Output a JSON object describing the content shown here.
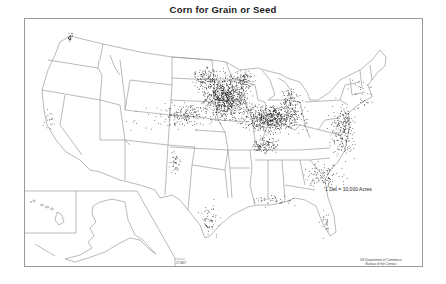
{
  "map": {
    "title": "Corn for Grain or Seed",
    "legend": "1 Dot = 10,000 Acres",
    "credit_line1": "US Department of Commerce",
    "credit_line2": "Bureau of the Census",
    "map_code": "27-M07",
    "colors": {
      "background": "#ffffff",
      "frame": "#9a9a9a",
      "state_lines": "#8c8c8c",
      "dots": "#111111"
    },
    "insets": [
      "Hawaii",
      "Alaska"
    ],
    "dot_clusters": [
      {
        "region": "Iowa-Minnesota-Nebraska core",
        "cx": 225,
        "cy": 97,
        "rx": 22,
        "ry": 22,
        "count": 900
      },
      {
        "region": "Illinois-Indiana-Ohio belt",
        "cx": 272,
        "cy": 118,
        "rx": 30,
        "ry": 13,
        "count": 700
      },
      {
        "region": "South Dakota east",
        "cx": 205,
        "cy": 78,
        "rx": 12,
        "ry": 12,
        "count": 120
      },
      {
        "region": "Nebraska-Kansas",
        "cx": 185,
        "cy": 115,
        "rx": 20,
        "ry": 12,
        "count": 160
      },
      {
        "region": "Kentucky-Tennessee",
        "cx": 265,
        "cy": 145,
        "rx": 14,
        "ry": 10,
        "count": 120
      },
      {
        "region": "Virginia-Maryland-Pennsylvania",
        "cx": 342,
        "cy": 130,
        "rx": 12,
        "ry": 25,
        "count": 220
      },
      {
        "region": "Michigan",
        "cx": 290,
        "cy": 100,
        "rx": 10,
        "ry": 12,
        "count": 90
      },
      {
        "region": "Carolinas-Georgia",
        "cx": 325,
        "cy": 175,
        "rx": 18,
        "ry": 14,
        "count": 110
      },
      {
        "region": "Texas coast",
        "cx": 210,
        "cy": 220,
        "rx": 10,
        "ry": 18,
        "count": 60
      },
      {
        "region": "Texas panhandle",
        "cx": 175,
        "cy": 162,
        "rx": 6,
        "ry": 12,
        "count": 40
      },
      {
        "region": "Gulf coast",
        "cx": 275,
        "cy": 200,
        "rx": 25,
        "ry": 5,
        "count": 45
      },
      {
        "region": "Florida",
        "cx": 325,
        "cy": 222,
        "rx": 5,
        "ry": 12,
        "count": 25
      },
      {
        "region": "New England",
        "cx": 362,
        "cy": 95,
        "rx": 12,
        "ry": 15,
        "count": 30
      },
      {
        "region": "Wisconsin",
        "cx": 245,
        "cy": 80,
        "rx": 12,
        "ry": 10,
        "count": 90
      },
      {
        "region": "California central",
        "cx": 49,
        "cy": 120,
        "rx": 6,
        "ry": 10,
        "count": 18
      },
      {
        "region": "Washington",
        "cx": 70,
        "cy": 37,
        "rx": 2,
        "ry": 4,
        "count": 25
      },
      {
        "region": "Colorado-West scattered",
        "cx": 150,
        "cy": 120,
        "rx": 25,
        "ry": 20,
        "count": 25
      }
    ]
  }
}
